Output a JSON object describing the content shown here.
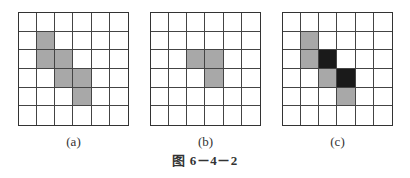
{
  "figure": {
    "caption": "图 6－4－2",
    "colors": {
      "gray": "#a8a8a8",
      "black": "#1a1a1a",
      "white": "#ffffff",
      "line": "#444444"
    },
    "panels": [
      {
        "label": "(a)",
        "rows": 6,
        "cols": 6,
        "cells": [
          [
            "w",
            "w",
            "w",
            "w",
            "w",
            "w"
          ],
          [
            "w",
            "g",
            "w",
            "w",
            "w",
            "w"
          ],
          [
            "w",
            "g",
            "g",
            "w",
            "w",
            "w"
          ],
          [
            "w",
            "w",
            "g",
            "g",
            "w",
            "w"
          ],
          [
            "w",
            "w",
            "w",
            "g",
            "w",
            "w"
          ],
          [
            "w",
            "w",
            "w",
            "w",
            "w",
            "w"
          ]
        ]
      },
      {
        "label": "(b)",
        "rows": 6,
        "cols": 6,
        "cells": [
          [
            "w",
            "w",
            "w",
            "w",
            "w",
            "w"
          ],
          [
            "w",
            "w",
            "w",
            "w",
            "w",
            "w"
          ],
          [
            "w",
            "w",
            "g",
            "g",
            "w",
            "w"
          ],
          [
            "w",
            "w",
            "w",
            "g",
            "w",
            "w"
          ],
          [
            "w",
            "w",
            "w",
            "w",
            "w",
            "w"
          ],
          [
            "w",
            "w",
            "w",
            "w",
            "w",
            "w"
          ]
        ]
      },
      {
        "label": "(c)",
        "rows": 6,
        "cols": 6,
        "cells": [
          [
            "w",
            "w",
            "w",
            "w",
            "w",
            "w"
          ],
          [
            "w",
            "g",
            "w",
            "w",
            "w",
            "w"
          ],
          [
            "w",
            "g",
            "b",
            "w",
            "w",
            "w"
          ],
          [
            "w",
            "w",
            "g",
            "b",
            "w",
            "w"
          ],
          [
            "w",
            "w",
            "w",
            "g",
            "w",
            "w"
          ],
          [
            "w",
            "w",
            "w",
            "w",
            "w",
            "w"
          ]
        ]
      }
    ]
  }
}
